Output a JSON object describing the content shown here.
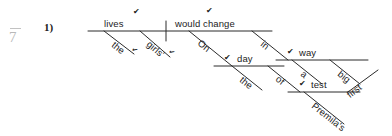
{
  "page": {
    "grade_mark": "7",
    "item_number": "1)"
  },
  "diagram": {
    "type": "reed-kellogg-sentence-diagram",
    "sentence": "On the day of Premila's first test, the girls' lives would change in a big way.",
    "subject": {
      "word": "lives",
      "check": "✔"
    },
    "predicate": {
      "word": "would change",
      "check": "✔"
    },
    "subject_modifiers": [
      {
        "word": "the",
        "check": "✔"
      },
      {
        "word": "girls'",
        "check": "✔"
      }
    ],
    "phrase_on": {
      "preposition": "On",
      "object": "day",
      "object_check": "✔",
      "object_modifier": "the",
      "nested": {
        "preposition": "of",
        "object": "test",
        "object_check": "✔",
        "modifiers": [
          "Premila's",
          "first"
        ]
      }
    },
    "phrase_in": {
      "preposition": "in",
      "object": "way",
      "object_check": "✔",
      "modifiers": [
        "a",
        "big"
      ]
    }
  }
}
